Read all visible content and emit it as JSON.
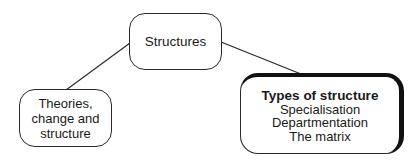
{
  "diagram": {
    "type": "hierarchy",
    "root": {
      "label": "Structures"
    },
    "children": [
      {
        "id": "left",
        "lines": [
          "Theories,",
          "change and",
          "structure"
        ],
        "highlighted": false
      },
      {
        "id": "right",
        "heading": "Types of structure",
        "items": [
          "Specialisation",
          "Departmentation",
          "The matrix"
        ],
        "highlighted": true
      }
    ],
    "edges": [
      {
        "from": "Structures",
        "to": "Theories, change and structure"
      },
      {
        "from": "Structures",
        "to": "Types of structure"
      }
    ],
    "colors": {
      "line": "#2a2a2a",
      "highlight_border": "#111111",
      "background": "#ffffff"
    }
  }
}
